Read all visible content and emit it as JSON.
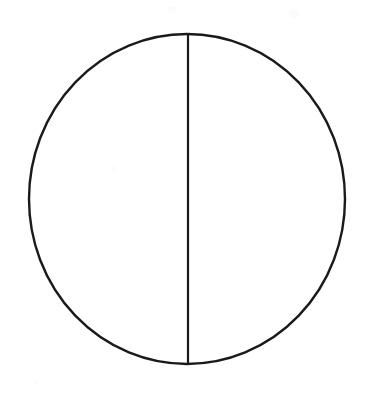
{
  "figure": {
    "title": "Bisected Circle",
    "background_color": "#ffffff",
    "stroke_color": "#1a1a1a",
    "canvas": {
      "width": 369,
      "height": 397
    },
    "shapes": [
      {
        "name": "circle-outline",
        "type": "ellipse",
        "center_x": 187,
        "center_y": 199,
        "radius_x": 158,
        "radius_y": 165,
        "stroke_width": 2.4,
        "fill": "none",
        "stroke": "#1a1a1a"
      },
      {
        "name": "vertical-diameter",
        "type": "line",
        "x1": 188,
        "y1": 34,
        "x2": 188,
        "y2": 364,
        "stroke_width": 2.2,
        "stroke": "#1a1a1a"
      }
    ],
    "regions": [
      {
        "name": "left-half",
        "label": ""
      },
      {
        "name": "right-half",
        "label": ""
      }
    ]
  },
  "chart_data": {
    "type": "pie",
    "title": "",
    "categories": [
      "Left half",
      "Right half"
    ],
    "values": [
      50,
      50
    ],
    "labels_visible": false,
    "legend": "none",
    "grid": false
  }
}
